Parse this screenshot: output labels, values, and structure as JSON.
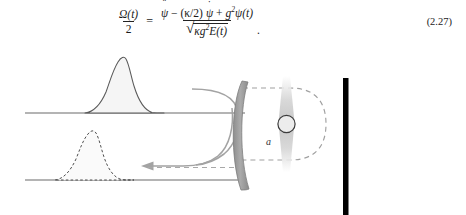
{
  "equation": {
    "id": "2.27",
    "number_label": "(2.27)",
    "lhs": {
      "numerator": "Ω(t)",
      "denominator": "2"
    },
    "relation": "=",
    "rhs": {
      "numerator_parts": [
        {
          "text": "ψ",
          "accent": "double-dot"
        },
        {
          "text": "− (κ/2)"
        },
        {
          "text": "ψ",
          "accent": "dot"
        },
        {
          "text": "+"
        },
        {
          "text": "g",
          "superscript": "2"
        },
        {
          "text": "ψ(t)"
        }
      ],
      "denominator_parts": [
        {
          "text": "κ"
        },
        {
          "text": "g",
          "superscript": "2"
        },
        {
          "text": "E(t)"
        }
      ],
      "denominator_is_sqrt": true
    },
    "terminator": ".",
    "plain_text": "Ω(t)/2 = ( ψ̈ − (κ/2) ψ̇ + g²ψ(t) ) / √( κg²E(t) )",
    "symbols": {
      "omega": "Ω",
      "psi": "ψ",
      "kappa": "κ",
      "g": "g",
      "E": "E",
      "t": "t",
      "two": "2",
      "sqrt": "√"
    }
  },
  "figure": {
    "caption_labels": {
      "atom_mode": "a"
    },
    "colors": {
      "waveguide_line": "#666666",
      "pulse_solid_stroke": "#555555",
      "pulse_fill": "#f4f4f4",
      "pulse_dashed_stroke": "#555555",
      "mirror_fill": "#9a9a9a",
      "mirror_stroke": "#707070",
      "cavity_dashed": "#9a9a9a",
      "coupling_curve": "#9a9a9a",
      "arrow": "#9a9a9a",
      "atom_circle_stroke": "#444444",
      "atom_circle_fill": "#e8e8e8",
      "beam_gradient": "#c9c9c9",
      "black_bar": "#000000"
    },
    "elements": [
      {
        "name": "waveguide-top-line",
        "type": "line"
      },
      {
        "name": "waveguide-bottom-line",
        "type": "line"
      },
      {
        "name": "incoming-pulse-solid",
        "type": "pulse",
        "style": "solid"
      },
      {
        "name": "outgoing-pulse-dashed",
        "type": "pulse",
        "style": "dashed"
      },
      {
        "name": "curved-mirror",
        "type": "crescent"
      },
      {
        "name": "cavity-loop-dashed",
        "type": "loop"
      },
      {
        "name": "atom-circle",
        "type": "circle"
      },
      {
        "name": "pump-beam",
        "type": "gradient-beam"
      },
      {
        "name": "coupling-curve-top",
        "type": "curve"
      },
      {
        "name": "return-arrow",
        "type": "arrow",
        "direction": "left"
      },
      {
        "name": "end-mirror-bar",
        "type": "bar"
      }
    ]
  }
}
